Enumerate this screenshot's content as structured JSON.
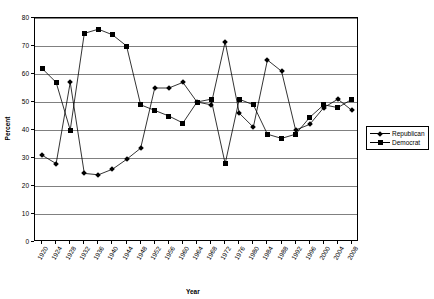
{
  "chart_data": {
    "type": "line",
    "title": "",
    "xlabel": "Year",
    "ylabel": "Percent",
    "ylim": [
      0,
      80
    ],
    "ytick_step": 10,
    "grid": true,
    "legend_position": "right",
    "categories": [
      "1920",
      "1924",
      "1928",
      "1932",
      "1936",
      "1940",
      "1944",
      "1948",
      "1952",
      "1956",
      "1960",
      "1964",
      "1968",
      "1972",
      "1976",
      "1980",
      "1984",
      "1988",
      "1992",
      "1996",
      "2000",
      "2004",
      "2008"
    ],
    "yticks": [
      "0",
      "10",
      "20",
      "30",
      "40",
      "50",
      "60",
      "70",
      "80"
    ],
    "series": [
      {
        "name": "Republican",
        "marker": "diamond",
        "color": "#000000",
        "values": [
          31,
          28,
          57,
          24.5,
          24,
          26,
          29.5,
          33.5,
          55,
          55,
          57,
          50,
          49,
          71.5,
          46,
          41,
          65,
          61,
          40,
          42,
          48,
          51,
          47
        ]
      },
      {
        "name": "Democrat",
        "marker": "square",
        "color": "#000000",
        "values": [
          62,
          57,
          40,
          74.5,
          76,
          74,
          70,
          49,
          47,
          45,
          42.5,
          50,
          51,
          28,
          51,
          49,
          38.5,
          37,
          38.5,
          44.5,
          49,
          48,
          51
        ]
      }
    ]
  },
  "legend": {
    "items": [
      {
        "label": "Republican"
      },
      {
        "label": "Democrat"
      }
    ]
  }
}
